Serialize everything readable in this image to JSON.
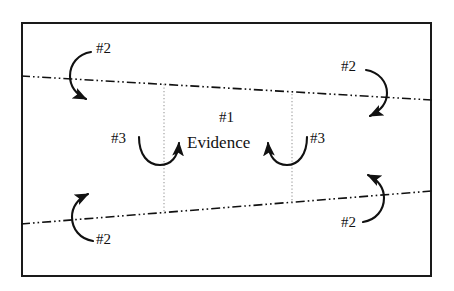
{
  "figure": {
    "type": "diagram",
    "background_color": "#ffffff",
    "frame": {
      "name": "outer-border",
      "x": 21,
      "y": 22,
      "width": 411,
      "height": 255,
      "stroke_color": "#1a1a1a",
      "stroke_width": 2,
      "fill": "#ffffff"
    },
    "center_text": {
      "heading": "#1",
      "label": "Evidence"
    },
    "boundary_lines": [
      {
        "name": "upper-boundary-line",
        "style": "dash-dot-dot",
        "stroke_color": "#111111",
        "x1": 21,
        "y1": 76,
        "x2": 432,
        "y2": 100
      },
      {
        "name": "lower-boundary-line",
        "style": "dash-dot-dot",
        "stroke_color": "#111111",
        "x1": 21,
        "y1": 224,
        "x2": 432,
        "y2": 191
      }
    ],
    "vertical_guides": [
      {
        "name": "left-vertical-guide",
        "style": "dotted",
        "stroke_color": "#9a9a9a",
        "x": 164,
        "y1": 84,
        "y2": 213
      },
      {
        "name": "right-vertical-guide",
        "style": "dotted",
        "stroke_color": "#9a9a9a",
        "x": 292,
        "y1": 94,
        "y2": 203
      }
    ],
    "arrow_labels": [
      {
        "id": "top-left",
        "text": "#2",
        "x": 96,
        "y": 48
      },
      {
        "id": "top-right",
        "text": "#2",
        "x": 344,
        "y": 66
      },
      {
        "id": "center-left",
        "text": "#3",
        "x": 113,
        "y": 138
      },
      {
        "id": "center-right",
        "text": "#3",
        "x": 312,
        "y": 138
      },
      {
        "id": "bottom-left",
        "text": "#2",
        "x": 96,
        "y": 235
      },
      {
        "id": "bottom-right",
        "text": "#2",
        "x": 344,
        "y": 218
      }
    ],
    "curved_arrows": [
      {
        "id": "top-left-arrow",
        "label": "#2",
        "direction": "downward-clockwise",
        "arrowhead": "down-right"
      },
      {
        "id": "top-right-arrow",
        "label": "#2",
        "direction": "downward-clockwise",
        "arrowhead": "down-left"
      },
      {
        "id": "center-left-arrow",
        "label": "#3",
        "direction": "u-turn-upward",
        "arrowhead": "up-right"
      },
      {
        "id": "center-right-arrow",
        "label": "#3",
        "direction": "u-turn-upward",
        "arrowhead": "up-left"
      },
      {
        "id": "bottom-left-arrow",
        "label": "#2",
        "direction": "upward-counterclockwise",
        "arrowhead": "up-right"
      },
      {
        "id": "bottom-right-arrow",
        "label": "#2",
        "direction": "upward-counterclockwise",
        "arrowhead": "up-left"
      }
    ],
    "center_labels": {
      "heading_x": 228,
      "heading_y": 118,
      "evidence_x": 228,
      "evidence_y": 144
    }
  }
}
